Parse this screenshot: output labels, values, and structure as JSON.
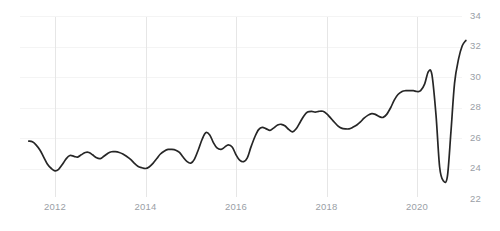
{
  "chart_data": {
    "type": "line",
    "title": "",
    "subtitle": "",
    "xlabel": "",
    "ylabel": "",
    "grid": {
      "vertical": true,
      "horizontal": true,
      "vertical_color": "#e6e6e6",
      "horizontal_color": "#f4f4f4"
    },
    "legend": {
      "visible": false,
      "position": "none",
      "entries": []
    },
    "annotations": [],
    "line_color": "#262626",
    "label_color": "#9aa0a6",
    "background_color": "#ffffff",
    "xlim": [
      2011.4,
      2021.1
    ],
    "ylim": [
      22,
      34
    ],
    "yticks": [
      22,
      24,
      26,
      28,
      30,
      32,
      34
    ],
    "ytick_labels": [
      "22",
      "24",
      "26",
      "28",
      "30",
      "32",
      "34"
    ],
    "ytick_position": "right",
    "xticks": [
      2012,
      2014,
      2016,
      2018,
      2020
    ],
    "xtick_labels": [
      "2012",
      "2014",
      "2016",
      "2018",
      "2020"
    ],
    "series": [
      {
        "name": "series-1",
        "color": "#262626",
        "x": [
          2011.42,
          2011.5,
          2011.58,
          2011.67,
          2011.75,
          2011.83,
          2011.92,
          2012.0,
          2012.08,
          2012.17,
          2012.25,
          2012.33,
          2012.42,
          2012.5,
          2012.58,
          2012.67,
          2012.75,
          2012.83,
          2012.92,
          2013.0,
          2013.08,
          2013.17,
          2013.25,
          2013.33,
          2013.42,
          2013.5,
          2013.58,
          2013.67,
          2013.75,
          2013.83,
          2013.92,
          2014.0,
          2014.08,
          2014.17,
          2014.25,
          2014.33,
          2014.42,
          2014.5,
          2014.58,
          2014.67,
          2014.75,
          2014.83,
          2014.92,
          2015.0,
          2015.08,
          2015.17,
          2015.25,
          2015.33,
          2015.42,
          2015.5,
          2015.58,
          2015.67,
          2015.75,
          2015.83,
          2015.92,
          2016.0,
          2016.08,
          2016.17,
          2016.25,
          2016.33,
          2016.42,
          2016.5,
          2016.58,
          2016.67,
          2016.75,
          2016.83,
          2016.92,
          2017.0,
          2017.08,
          2017.17,
          2017.25,
          2017.33,
          2017.42,
          2017.5,
          2017.58,
          2017.67,
          2017.75,
          2017.83,
          2017.92,
          2018.0,
          2018.08,
          2018.17,
          2018.25,
          2018.33,
          2018.42,
          2018.5,
          2018.58,
          2018.67,
          2018.75,
          2018.83,
          2018.92,
          2019.0,
          2019.08,
          2019.17,
          2019.25,
          2019.33,
          2019.42,
          2019.5,
          2019.58,
          2019.67,
          2019.75,
          2019.83,
          2019.92,
          2020.0,
          2020.08,
          2020.17,
          2020.25,
          2020.33,
          2020.42,
          2020.5,
          2020.58,
          2020.67,
          2020.75,
          2020.83,
          2020.92,
          2021.0,
          2021.08
        ],
        "values": [
          25.8,
          25.75,
          25.55,
          25.2,
          24.75,
          24.3,
          24.0,
          23.85,
          23.95,
          24.3,
          24.65,
          24.85,
          24.8,
          24.75,
          24.9,
          25.05,
          25.05,
          24.9,
          24.7,
          24.65,
          24.8,
          25.0,
          25.1,
          25.1,
          25.05,
          24.95,
          24.8,
          24.6,
          24.35,
          24.15,
          24.05,
          24.0,
          24.1,
          24.35,
          24.65,
          24.95,
          25.15,
          25.25,
          25.25,
          25.2,
          25.05,
          24.75,
          24.45,
          24.35,
          24.6,
          25.25,
          25.9,
          26.35,
          26.2,
          25.7,
          25.35,
          25.25,
          25.4,
          25.55,
          25.4,
          24.9,
          24.55,
          24.45,
          24.7,
          25.4,
          26.1,
          26.55,
          26.7,
          26.6,
          26.5,
          26.65,
          26.85,
          26.9,
          26.8,
          26.55,
          26.4,
          26.6,
          27.05,
          27.45,
          27.7,
          27.75,
          27.7,
          27.75,
          27.75,
          27.6,
          27.35,
          27.05,
          26.8,
          26.65,
          26.6,
          26.6,
          26.7,
          26.85,
          27.05,
          27.3,
          27.5,
          27.6,
          27.55,
          27.4,
          27.35,
          27.55,
          28.0,
          28.5,
          28.85,
          29.05,
          29.1,
          29.1,
          29.1,
          29.05,
          29.1,
          29.55,
          30.35,
          30.15,
          27.5,
          24.1,
          23.2,
          23.45,
          26.4,
          29.6,
          31.2,
          32.05,
          32.4
        ]
      }
    ]
  }
}
